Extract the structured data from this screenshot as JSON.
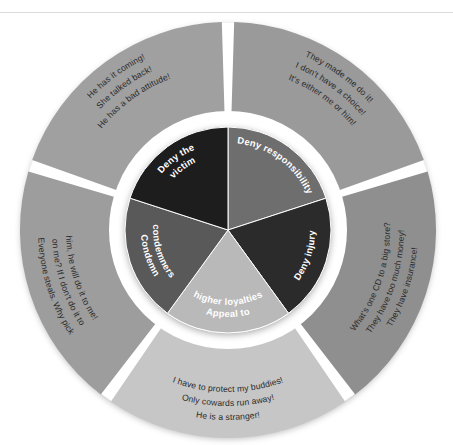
{
  "page": {
    "background_color": "#ffffff",
    "rule_color": "#d9d9d9"
  },
  "diagram": {
    "type": "ring-and-pie",
    "center": {
      "x": 228,
      "y": 230
    },
    "inner_radius": 103,
    "ring_inner_radius": 118,
    "ring_outer_radius": 208,
    "gap_color": "#ffffff",
    "segments": [
      {
        "id": "deny-responsibility",
        "inner_label": "Deny responsibility",
        "inner_color": "#6e6e6e",
        "outer_color": "#9a9a9a",
        "start_angle": -90,
        "end_angle": -18,
        "outer_lines": [
          "They made me do it!",
          "I don't have a choice!",
          "It's either me or him!"
        ]
      },
      {
        "id": "deny-injury",
        "inner_label": "Deny injury",
        "inner_color": "#2b2b2b",
        "outer_color": "#8f8f8f",
        "start_angle": -18,
        "end_angle": 54,
        "outer_lines": [
          "They have insurance!",
          "They have too much money!",
          "What's one CD to a big store?"
        ]
      },
      {
        "id": "appeal-to-higher-loyalties",
        "inner_label": "Appeal to\nhigher loyalties",
        "inner_color": "#b9b9b9",
        "outer_color": "#c6c6c6",
        "start_angle": 54,
        "end_angle": 126,
        "outer_lines": [
          "He is a stranger!",
          "Only cowards run away!",
          "I have to protect my buddies!"
        ]
      },
      {
        "id": "condemn-condemners",
        "inner_label": "Condemn\ncondemners",
        "inner_color": "#595959",
        "outer_color": "#9d9d9d",
        "start_angle": 126,
        "end_angle": 198,
        "outer_lines": [
          "Everyone steals. Why pick",
          "on me? If I don't do it to",
          "him, he will do it to me!"
        ]
      },
      {
        "id": "deny-the-victim",
        "inner_label": "Deny the\nvictim",
        "inner_color": "#1d1d1d",
        "outer_color": "#a0a0a0",
        "start_angle": 198,
        "end_angle": 270,
        "outer_lines": [
          "He has it coming!",
          "She talked back!",
          "He has a bad attitude!"
        ]
      }
    ]
  }
}
